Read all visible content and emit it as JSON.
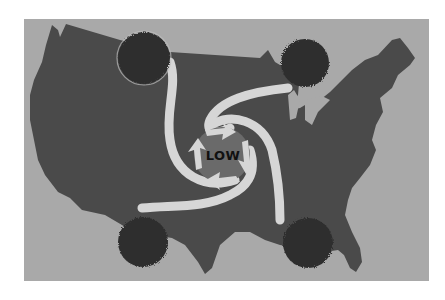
{
  "diagram": {
    "center_label": "LOW",
    "colors": {
      "page_background": "#ffffff",
      "frame_background": "#a9a9a9",
      "landmass": "#4a4a4a",
      "high_pressure_puff": "#2e2e2e",
      "airflow_band": "#d6d6d6",
      "low_center": "#6a6a6a",
      "label_text": "#111111"
    },
    "pressure_cells": [
      {
        "id": "northwest",
        "type": "high",
        "cx": 144,
        "cy": 58
      },
      {
        "id": "northeast",
        "type": "high",
        "cx": 305,
        "cy": 63
      },
      {
        "id": "southwest",
        "type": "high",
        "cx": 143,
        "cy": 242
      },
      {
        "id": "southeast",
        "type": "high",
        "cx": 308,
        "cy": 243
      }
    ],
    "center": {
      "type": "low",
      "cx": 222,
      "cy": 155
    }
  }
}
